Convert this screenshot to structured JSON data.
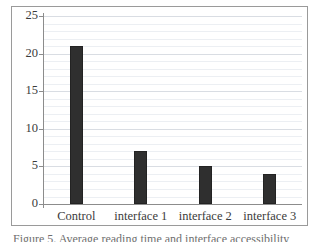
{
  "figure": {
    "caption": "Figure 5. Average reading time and interface accessibility"
  },
  "chart_data": {
    "type": "bar",
    "title": "",
    "xlabel": "",
    "ylabel": "",
    "categories": [
      "Control",
      "interface 1",
      "interface 2",
      "interface 3"
    ],
    "values": [
      21,
      7,
      5,
      4
    ],
    "ylim": [
      0,
      25
    ],
    "ytick_labels": [
      "0",
      "5",
      "10",
      "15",
      "20",
      "25"
    ],
    "ytick_values": [
      0,
      5,
      10,
      15,
      20,
      25
    ],
    "grid": true,
    "grid_minor_step": 1,
    "legend": "none",
    "bar_color": "#2f2f2f",
    "plot_background": "#ffffff",
    "grid_color": "#eceff3",
    "grid_major_color": "#d9dde3",
    "axis_color": "#8c8c8c",
    "frame_color": "#9a9a9a"
  }
}
